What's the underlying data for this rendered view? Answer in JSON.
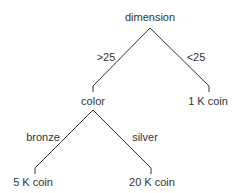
{
  "diagram": {
    "type": "decision-tree",
    "root": {
      "label": "dimension"
    },
    "nodes": [
      {
        "id": "dimension",
        "label": "dimension",
        "x": 150,
        "y": 12
      },
      {
        "id": "color",
        "label": "color",
        "x": 93,
        "y": 95
      },
      {
        "id": "coin1k",
        "label": "1 K coin",
        "x": 208,
        "y": 95
      },
      {
        "id": "coin5k",
        "label": "5 K coin",
        "x": 33,
        "y": 176
      },
      {
        "id": "coin20k",
        "label": "20 K coin",
        "x": 152,
        "y": 176
      }
    ],
    "edges": [
      {
        "from": "dimension",
        "to": "color",
        "label": ">25",
        "lx": 107,
        "ly": 51
      },
      {
        "from": "dimension",
        "to": "coin1k",
        "label": "<25",
        "lx": 196,
        "ly": 51
      },
      {
        "from": "color",
        "to": "coin5k",
        "label": "bronze",
        "lx": 43,
        "ly": 131
      },
      {
        "from": "color",
        "to": "coin20k",
        "label": "silver",
        "lx": 145,
        "ly": 131
      }
    ],
    "line_color": "#333333"
  }
}
